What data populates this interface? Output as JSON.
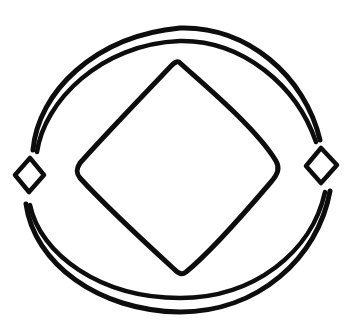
{
  "document": {
    "title": "Hand-drawn geometric sketch",
    "background_color": "#ffffff",
    "ink_color": "#0d0d0d",
    "width": 358,
    "height": 334
  },
  "figure": {
    "style": "hand-drawn",
    "elements": [
      {
        "name": "outer-arc-top",
        "type": "arc",
        "label": "Outer upper arc",
        "stroke_width": 5,
        "path": "M 33 150 C 38 92 95 36 180 28 C 247 26 305 76 320 140"
      },
      {
        "name": "inner-arc-top",
        "type": "arc",
        "label": "Inner upper arc",
        "stroke_width": 4.5,
        "path": "M 37 152 C 44 102 100 44 180 41 C 243 40 297 86 316 142"
      },
      {
        "name": "outer-arc-bottom",
        "type": "arc",
        "label": "Outer lower arc",
        "stroke_width": 5,
        "path": "M 26 204 C 34 263 98 311 180 312 C 258 312 318 258 330 191"
      },
      {
        "name": "inner-arc-bottom",
        "type": "arc",
        "label": "Inner lower arc",
        "stroke_width": 4.5,
        "path": "M 30 205 C 40 254 100 298 180 298 C 254 298 312 252 325 192"
      },
      {
        "name": "center-rounded-diamond",
        "type": "rounded-diamond",
        "label": "Central rounded diamond",
        "stroke_width": 5,
        "path": "M 179 62 C 196 78 255 126 276 161 C 280 168 278 174 271 182 C 248 209 207 255 186 272 C 182 275 179 274 174 269 C 150 247 100 200 80 178 C 76 173 76 169 80 163 C 101 139 152 86 172 65 C 175 62 177 61 179 62 Z"
      },
      {
        "name": "left-small-diamond",
        "type": "diamond",
        "label": "Left gap diamond",
        "stroke_width": 4.5,
        "path": "M 30 158 L 44 175 L 29 192 L 15 175 Z"
      },
      {
        "name": "right-small-diamond",
        "type": "diamond",
        "label": "Right gap diamond",
        "stroke_width": 4.5,
        "path": "M 321 148 L 337 165 L 321 183 L 306 166 Z"
      }
    ]
  }
}
